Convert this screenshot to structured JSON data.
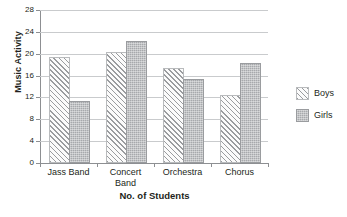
{
  "chart_data": {
    "type": "bar",
    "title": "",
    "xlabel": "No. of Students",
    "ylabel": "Music Activity",
    "categories": [
      "Jass Band",
      "Concert\nBand",
      "Orchestra",
      "Chorus"
    ],
    "series": [
      {
        "name": "Boys",
        "values": [
          19,
          20,
          17,
          12
        ],
        "pattern": "diagonal-hatch",
        "color": "#9a9c9f"
      },
      {
        "name": "Girls",
        "values": [
          11,
          22,
          15,
          18
        ],
        "pattern": "dotted-fill",
        "color": "#a7a9ac"
      }
    ],
    "ylim": [
      0,
      28
    ],
    "yticks": [
      0,
      4,
      8,
      12,
      16,
      20,
      24,
      28
    ],
    "ytick_labels": [
      "0",
      "4",
      "8",
      "12",
      "16",
      "20",
      "24",
      "28"
    ],
    "grid": true,
    "grid_axis": "y",
    "legend_position": "right"
  },
  "legend": {
    "items": [
      {
        "label": "Boys"
      },
      {
        "label": "Girls"
      }
    ]
  },
  "colors": {
    "axis": "#8d8f92",
    "grid": "#c9cbcd",
    "text": "#231f20",
    "boys": "#9a9c9f",
    "girls": "#a7a9ac"
  }
}
